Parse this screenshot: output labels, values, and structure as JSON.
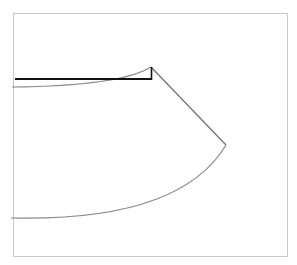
{
  "diagram": {
    "type": "geometric-figure",
    "colors": {
      "background": "#ffffff",
      "frame": "#c8c8c8",
      "arc": "#8a8a8a",
      "edge": "#777777",
      "black_line": "#111111"
    },
    "frame": {
      "x": 13,
      "y": 13,
      "width": 275,
      "height": 244
    },
    "points": {
      "apex": {
        "x": 151,
        "y": 67
      },
      "right_vertex": {
        "x": 226,
        "y": 145
      },
      "upper_arc_start": {
        "x": 13,
        "y": 87
      },
      "lower_arc_start": {
        "x": 12,
        "y": 218
      },
      "black_line_start": {
        "x": 15,
        "y": 79
      },
      "black_line_end": {
        "x": 151,
        "y": 79
      }
    }
  }
}
